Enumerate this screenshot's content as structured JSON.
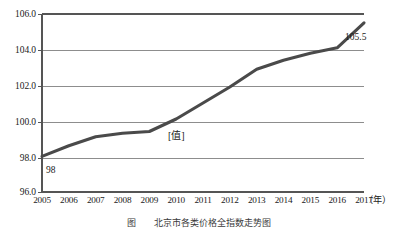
{
  "chart_data": {
    "type": "line",
    "title": "",
    "xlabel": "年",
    "ylabel": "",
    "x": [
      2005,
      2006,
      2007,
      2008,
      2009,
      2010,
      2011,
      2012,
      2013,
      2014,
      2015,
      2016,
      2017
    ],
    "categories": [
      "2005",
      "2006",
      "2007",
      "2008",
      "2009",
      "2010",
      "2011",
      "2012",
      "2013",
      "2014",
      "2015",
      "2016",
      "2017"
    ],
    "values": [
      98.0,
      98.6,
      99.1,
      99.3,
      99.4,
      100.1,
      101.0,
      101.9,
      102.9,
      103.4,
      103.8,
      104.1,
      105.5
    ],
    "series": [
      {
        "name": "指数",
        "values": [
          98.0,
          98.6,
          99.1,
          99.3,
          99.4,
          100.1,
          101.0,
          101.9,
          102.9,
          103.4,
          103.8,
          104.1,
          105.5
        ]
      }
    ],
    "ylim": [
      96.0,
      106.0
    ],
    "ytick_labels": [
      "96.0",
      "98.0",
      "100.0",
      "102.0",
      "104.0",
      "106.0"
    ],
    "ytick_values": [
      96.0,
      98.0,
      100.0,
      102.0,
      104.0,
      106.0
    ],
    "xtick_labels": [
      "2005",
      "2006",
      "2007",
      "2008",
      "2009",
      "2010",
      "2011",
      "2012",
      "2013",
      "2014",
      "2015",
      "2016",
      "2017"
    ],
    "x_unit_label": "（年）",
    "grid": true,
    "legend": "none",
    "line_color": "#4a4a4a",
    "grid_color": "#9a9a9a",
    "axis_color": "#555555",
    "annotations": [
      {
        "name": "start-value",
        "text": "98",
        "x": 2005,
        "y": 98.0
      },
      {
        "name": "series-value-label",
        "text": "[值]",
        "x": 2011,
        "y": 100.0
      },
      {
        "name": "end-value",
        "text": "105.5",
        "x": 2017,
        "y": 105.5
      }
    ]
  },
  "caption": {
    "text": "图　　北京市各类价格全指数走势图"
  }
}
